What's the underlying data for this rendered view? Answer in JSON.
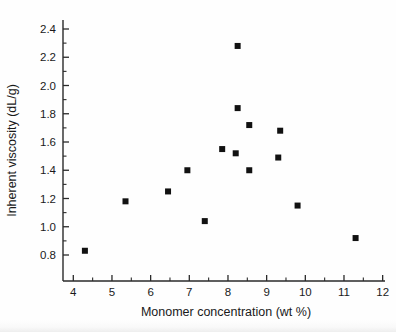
{
  "chart_data": {
    "type": "scatter",
    "title": "",
    "xlabel": "Monomer concentration (wt %)",
    "ylabel": "Inherent viscosity (dL/g)",
    "xlim": [
      3.55,
      12.1
    ],
    "ylim": [
      0.68,
      2.52
    ],
    "xticks": [
      4,
      5,
      6,
      7,
      8,
      9,
      10,
      11,
      12
    ],
    "xticklabels": [
      "4",
      "5",
      "6",
      "7",
      "8",
      "9",
      "10",
      "11",
      "12"
    ],
    "xminorticks": [
      4.5,
      5.5,
      6.5,
      7.5,
      8.5,
      9.5,
      10.5,
      11.5
    ],
    "yticks": [
      0.8,
      1.0,
      1.2,
      1.4,
      1.6,
      1.8,
      2.0,
      2.2,
      2.4
    ],
    "yticklabels": [
      "0.8",
      "1.0",
      "1.2",
      "1.4",
      "1.6",
      "1.8",
      "2.0",
      "2.2",
      "2.4"
    ],
    "yminorticks": [
      0.9,
      1.1,
      1.3,
      1.5,
      1.7,
      1.9,
      2.1,
      2.3
    ],
    "grid": false,
    "legend": null,
    "marker": "square",
    "marker_color": "#111111",
    "marker_size": 6,
    "points": [
      {
        "x": 4.3,
        "y": 0.83
      },
      {
        "x": 5.35,
        "y": 1.18
      },
      {
        "x": 6.45,
        "y": 1.25
      },
      {
        "x": 6.95,
        "y": 1.4
      },
      {
        "x": 7.4,
        "y": 1.04
      },
      {
        "x": 7.85,
        "y": 1.55
      },
      {
        "x": 8.2,
        "y": 1.52
      },
      {
        "x": 8.25,
        "y": 2.28
      },
      {
        "x": 8.25,
        "y": 1.84
      },
      {
        "x": 8.55,
        "y": 1.72
      },
      {
        "x": 8.55,
        "y": 1.4
      },
      {
        "x": 9.3,
        "y": 1.49
      },
      {
        "x": 9.35,
        "y": 1.68
      },
      {
        "x": 9.8,
        "y": 1.15
      },
      {
        "x": 11.3,
        "y": 0.92
      }
    ]
  },
  "axes_geometry": {
    "x_axis_px": {
      "left": 63,
      "right": 385,
      "y": 281
    },
    "y_axis_px": {
      "top": 20,
      "bottom": 281,
      "x": 63
    },
    "x_value_at_left_px": 3.55,
    "x_px_per_unit": 38.67,
    "x_px_at_4": 73.3,
    "y_px_per_unit": 141.25,
    "y_px_at_0_8": 255
  },
  "colors": {
    "marker": "#111111",
    "axis": "#2a2a2a",
    "text": "#1a1a1a",
    "background": "#ffffff"
  }
}
